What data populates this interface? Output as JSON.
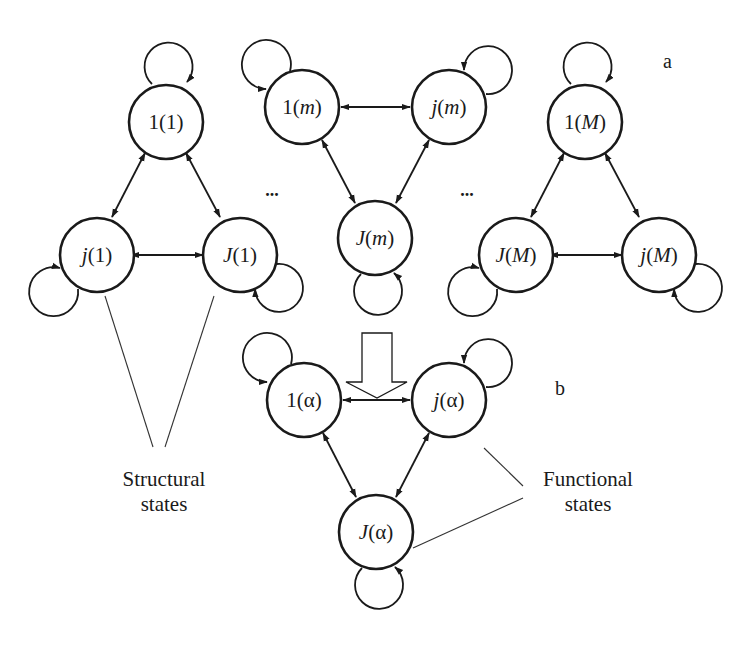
{
  "panels": {
    "a": {
      "label": "a"
    },
    "b": {
      "label": "b"
    }
  },
  "ellipses": [
    "...",
    "..."
  ],
  "groups": [
    {
      "id": "1",
      "nodes": [
        {
          "id": "1(1)",
          "prefix": "1",
          "prefix_italic": false,
          "arg": "1",
          "arg_italic": false
        },
        {
          "id": "j(1)",
          "prefix": "j",
          "prefix_italic": true,
          "arg": "1",
          "arg_italic": false
        },
        {
          "id": "J(1)",
          "prefix": "J",
          "prefix_italic": true,
          "arg": "1",
          "arg_italic": false
        }
      ]
    },
    {
      "id": "m",
      "nodes": [
        {
          "id": "1(m)",
          "prefix": "1",
          "prefix_italic": false,
          "arg": "m",
          "arg_italic": true
        },
        {
          "id": "j(m)",
          "prefix": "j",
          "prefix_italic": true,
          "arg": "m",
          "arg_italic": true
        },
        {
          "id": "J(m)",
          "prefix": "J",
          "prefix_italic": true,
          "arg": "m",
          "arg_italic": true
        }
      ]
    },
    {
      "id": "M",
      "nodes": [
        {
          "id": "1(M)",
          "prefix": "1",
          "prefix_italic": false,
          "arg": "M",
          "arg_italic": true
        },
        {
          "id": "J(M)",
          "prefix": "J",
          "prefix_italic": true,
          "arg": "M",
          "arg_italic": true
        },
        {
          "id": "j(M)",
          "prefix": "j",
          "prefix_italic": true,
          "arg": "M",
          "arg_italic": true
        }
      ]
    },
    {
      "id": "alpha",
      "nodes": [
        {
          "id": "1(α)",
          "prefix": "1",
          "prefix_italic": false,
          "arg": "α",
          "arg_italic": false
        },
        {
          "id": "j(α)",
          "prefix": "j",
          "prefix_italic": true,
          "arg": "α",
          "arg_italic": false
        },
        {
          "id": "J(α)",
          "prefix": "J",
          "prefix_italic": true,
          "arg": "α",
          "arg_italic": false
        }
      ]
    }
  ],
  "edges": [
    {
      "from": "1(1)",
      "to": "j(1)",
      "type": "bidirectional"
    },
    {
      "from": "1(1)",
      "to": "J(1)",
      "type": "bidirectional"
    },
    {
      "from": "j(1)",
      "to": "J(1)",
      "type": "bidirectional"
    },
    {
      "from": "1(m)",
      "to": "j(m)",
      "type": "bidirectional"
    },
    {
      "from": "1(m)",
      "to": "J(m)",
      "type": "bidirectional"
    },
    {
      "from": "j(m)",
      "to": "J(m)",
      "type": "bidirectional"
    },
    {
      "from": "1(M)",
      "to": "J(M)",
      "type": "bidirectional"
    },
    {
      "from": "1(M)",
      "to": "j(M)",
      "type": "bidirectional"
    },
    {
      "from": "J(M)",
      "to": "j(M)",
      "type": "bidirectional"
    },
    {
      "from": "1(α)",
      "to": "j(α)",
      "type": "bidirectional"
    },
    {
      "from": "1(α)",
      "to": "J(α)",
      "type": "bidirectional"
    },
    {
      "from": "j(α)",
      "to": "J(α)",
      "type": "bidirectional"
    }
  ],
  "self_loops": [
    "1(1)",
    "j(1)",
    "J(1)",
    "1(m)",
    "j(m)",
    "J(m)",
    "1(M)",
    "J(M)",
    "j(M)",
    "1(α)",
    "j(α)",
    "J(α)"
  ],
  "annotations": {
    "structural": {
      "line1": "Structural",
      "line2": "states"
    },
    "functional": {
      "line1": "Functional",
      "line2": "states"
    }
  },
  "transform_arrow": {
    "direction": "down",
    "meaning": "aggregation of structural states into functional states"
  }
}
